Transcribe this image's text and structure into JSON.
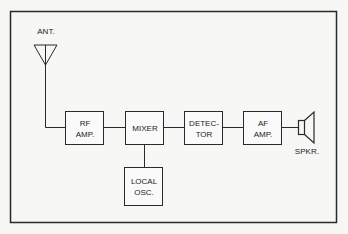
{
  "diagram": {
    "colors": {
      "background": "#f7f7f5",
      "stroke": "#2a2a2a",
      "text": "#222222"
    },
    "antenna": {
      "label": "ANT."
    },
    "blocks": {
      "rf_amp": {
        "line1": "RF",
        "line2": "AMP."
      },
      "mixer": {
        "line1": "MIXER"
      },
      "local_osc": {
        "line1": "LOCAL",
        "line2": "OSC."
      },
      "detector": {
        "line1": "DETEC-",
        "line2": "TOR"
      },
      "af_amp": {
        "line1": "AF",
        "line2": "AMP."
      }
    },
    "speaker": {
      "label": "SPKR."
    },
    "connections": [
      [
        "antenna",
        "rf_amp"
      ],
      [
        "rf_amp",
        "mixer"
      ],
      [
        "local_osc",
        "mixer"
      ],
      [
        "mixer",
        "detector"
      ],
      [
        "detector",
        "af_amp"
      ],
      [
        "af_amp",
        "speaker"
      ]
    ]
  }
}
